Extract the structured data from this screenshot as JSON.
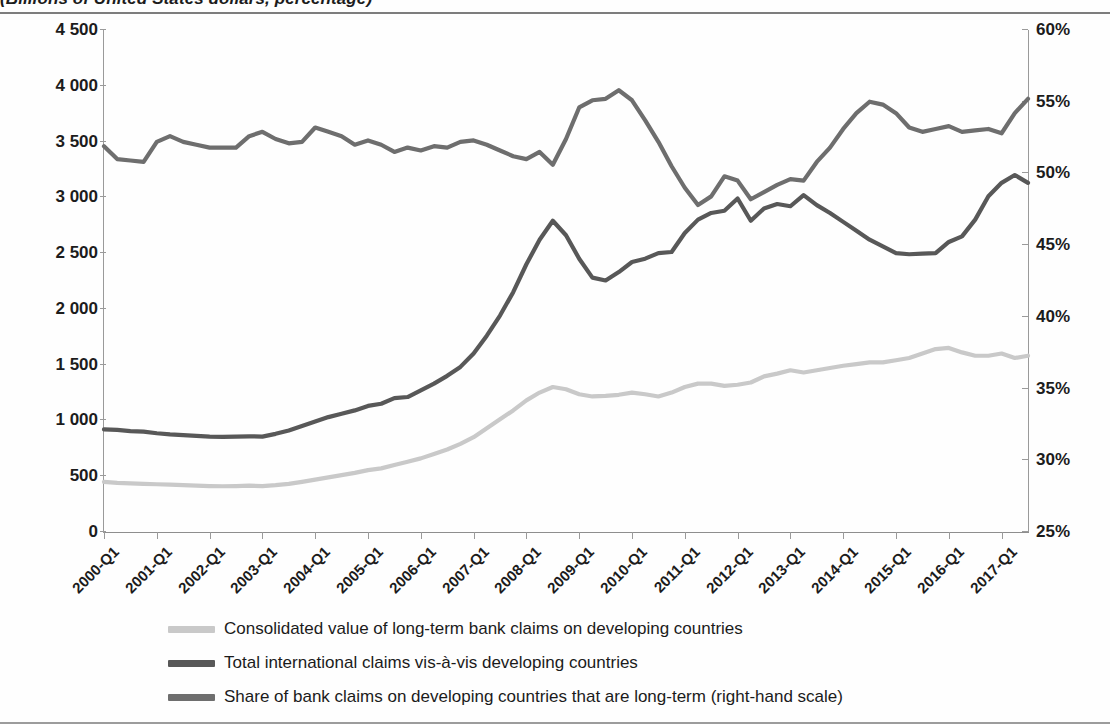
{
  "figure": {
    "subtitle": "(Billions of United States dollars, percentage)"
  },
  "legend": [
    {
      "label": "Consolidated value of long-term bank claims on developing countries",
      "color": "#c9c9c9",
      "swatch_name": "legend-swatch-consolidated"
    },
    {
      "label": "Total international claims vis-à-vis developing countries",
      "color": "#585858",
      "swatch_name": "legend-swatch-total"
    },
    {
      "label": "Share of bank claims on developing countries that are long-term (right-hand scale)",
      "color": "#6e6e6e",
      "swatch_name": "legend-swatch-share"
    }
  ],
  "chart_data": {
    "type": "line",
    "title": "",
    "subtitle": "(Billions of United States dollars, percentage)",
    "xlabel": "",
    "ylabel": "Billions of United States dollars",
    "y2label": "percentage",
    "grid": false,
    "legend_position": "bottom",
    "ylim": [
      0,
      4500
    ],
    "y2lim": [
      25,
      60
    ],
    "yticks": [
      "0",
      "500",
      "1 000",
      "1 500",
      "2 000",
      "2 500",
      "3 000",
      "3 500",
      "4 000",
      "4 500"
    ],
    "ytick_values": [
      0,
      500,
      1000,
      1500,
      2000,
      2500,
      3000,
      3500,
      4000,
      4500
    ],
    "y2ticks": [
      "25%",
      "30%",
      "35%",
      "40%",
      "45%",
      "50%",
      "55%",
      "60%"
    ],
    "y2tick_values": [
      25,
      30,
      35,
      40,
      45,
      50,
      55,
      60
    ],
    "xtick_labels": [
      "2000-Q1",
      "2001-Q1",
      "2002-Q1",
      "2003-Q1",
      "2004-Q1",
      "2005-Q1",
      "2006-Q1",
      "2007-Q1",
      "2008-Q1",
      "2009-Q1",
      "2010-Q1",
      "2011-Q1",
      "2012-Q1",
      "2013-Q1",
      "2014-Q1",
      "2015-Q1",
      "2016-Q1",
      "2017-Q1"
    ],
    "xtick_index": [
      0,
      4,
      8,
      12,
      16,
      20,
      24,
      28,
      32,
      36,
      40,
      44,
      48,
      52,
      56,
      60,
      64,
      68
    ],
    "x": [
      "2000-Q1",
      "2000-Q2",
      "2000-Q3",
      "2000-Q4",
      "2001-Q1",
      "2001-Q2",
      "2001-Q3",
      "2001-Q4",
      "2002-Q1",
      "2002-Q2",
      "2002-Q3",
      "2002-Q4",
      "2003-Q1",
      "2003-Q2",
      "2003-Q3",
      "2003-Q4",
      "2004-Q1",
      "2004-Q2",
      "2004-Q3",
      "2004-Q4",
      "2005-Q1",
      "2005-Q2",
      "2005-Q3",
      "2005-Q4",
      "2006-Q1",
      "2006-Q2",
      "2006-Q3",
      "2006-Q4",
      "2007-Q1",
      "2007-Q2",
      "2007-Q3",
      "2007-Q4",
      "2008-Q1",
      "2008-Q2",
      "2008-Q3",
      "2008-Q4",
      "2009-Q1",
      "2009-Q2",
      "2009-Q3",
      "2009-Q4",
      "2010-Q1",
      "2010-Q2",
      "2010-Q3",
      "2010-Q4",
      "2011-Q1",
      "2011-Q2",
      "2011-Q3",
      "2011-Q4",
      "2012-Q1",
      "2012-Q2",
      "2012-Q3",
      "2012-Q4",
      "2013-Q1",
      "2013-Q2",
      "2013-Q3",
      "2013-Q4",
      "2014-Q1",
      "2014-Q2",
      "2014-Q3",
      "2014-Q4",
      "2015-Q1",
      "2015-Q2",
      "2015-Q3",
      "2015-Q4",
      "2016-Q1",
      "2016-Q2",
      "2016-Q3",
      "2016-Q4",
      "2017-Q1",
      "2017-Q2",
      "2017-Q3"
    ],
    "series": [
      {
        "name": "Consolidated value of long-term bank claims on developing countries",
        "color": "#c9c9c9",
        "axis": "left",
        "unit": "billions of United States dollars",
        "values": [
          450,
          440,
          435,
          432,
          428,
          425,
          420,
          415,
          412,
          410,
          412,
          415,
          412,
          420,
          432,
          450,
          470,
          490,
          510,
          530,
          555,
          570,
          600,
          630,
          660,
          700,
          740,
          790,
          850,
          930,
          1010,
          1090,
          1180,
          1250,
          1300,
          1280,
          1235,
          1215,
          1220,
          1230,
          1250,
          1235,
          1215,
          1250,
          1300,
          1330,
          1330,
          1310,
          1320,
          1340,
          1395,
          1420,
          1450,
          1430,
          1450,
          1470,
          1490,
          1505,
          1520,
          1520,
          1540,
          1560,
          1600,
          1640,
          1650,
          1610,
          1580,
          1580,
          1600,
          1560,
          1580
        ]
      },
      {
        "name": "Total international claims vis-à-vis developing countries",
        "color": "#585858",
        "axis": "left",
        "unit": "billions of United States dollars",
        "values": [
          920,
          915,
          905,
          900,
          885,
          875,
          868,
          862,
          855,
          852,
          855,
          858,
          855,
          880,
          910,
          950,
          990,
          1030,
          1060,
          1090,
          1130,
          1150,
          1200,
          1210,
          1270,
          1330,
          1400,
          1480,
          1600,
          1760,
          1940,
          2150,
          2400,
          2620,
          2790,
          2660,
          2450,
          2280,
          2255,
          2330,
          2420,
          2450,
          2500,
          2510,
          2680,
          2800,
          2860,
          2880,
          2990,
          2790,
          2900,
          2940,
          2920,
          3020,
          2930,
          2860,
          2780,
          2700,
          2620,
          2560,
          2500,
          2490,
          2495,
          2500,
          2600,
          2650,
          2800,
          3010,
          3130,
          3200,
          3130
        ]
      },
      {
        "name": "Share of bank claims on developing countries that are long-term (right-hand scale)",
        "color": "#6e6e6e",
        "axis": "right",
        "unit": "percentage",
        "values": [
          51.9,
          51.0,
          50.9,
          50.8,
          52.2,
          52.6,
          52.2,
          52.0,
          51.8,
          51.8,
          51.8,
          52.6,
          52.9,
          52.4,
          52.1,
          52.2,
          53.2,
          52.9,
          52.6,
          52.0,
          52.3,
          52.0,
          51.5,
          51.8,
          51.6,
          51.9,
          51.8,
          52.2,
          52.3,
          52.0,
          51.6,
          51.2,
          51.0,
          51.5,
          50.6,
          52.4,
          54.6,
          55.1,
          55.2,
          55.8,
          55.1,
          53.7,
          52.2,
          50.5,
          49.0,
          47.8,
          48.4,
          49.8,
          49.5,
          48.2,
          48.7,
          49.2,
          49.6,
          49.5,
          50.8,
          51.8,
          53.1,
          54.2,
          55.0,
          54.8,
          54.2,
          53.2,
          52.9,
          53.1,
          53.3,
          52.9,
          53.0,
          53.1,
          52.8,
          54.2,
          55.2
        ]
      }
    ]
  }
}
